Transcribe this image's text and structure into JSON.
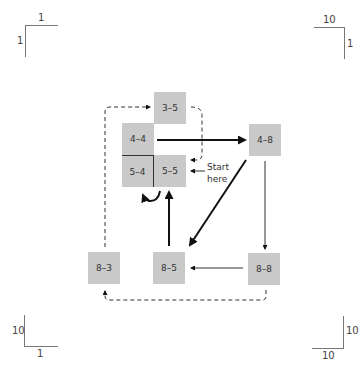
{
  "corners": {
    "top_left": {
      "top_label": "1",
      "side_label": "1"
    },
    "top_right": {
      "top_label": "10",
      "side_label": "1"
    },
    "bottom_left": {
      "side_label": "10",
      "bottom_label": "1"
    },
    "bottom_right": {
      "side_label": "10",
      "bottom_label": "10"
    }
  },
  "cells": [
    {
      "id": "3-5",
      "label": "3–5"
    },
    {
      "id": "4-4",
      "label": "4–4"
    },
    {
      "id": "5-4",
      "label": "5–4"
    },
    {
      "id": "5-5",
      "label": "5–5"
    },
    {
      "id": "4-8",
      "label": "4–8"
    },
    {
      "id": "8-3",
      "label": "8–3"
    },
    {
      "id": "8-5",
      "label": "8–5"
    },
    {
      "id": "8-8",
      "label": "8–8"
    }
  ],
  "annotation": {
    "start_line1": "Start",
    "start_line2": "here"
  },
  "edges": [
    {
      "from": "4-4",
      "to": "4-8",
      "style": "solid-thick"
    },
    {
      "from": "4-8",
      "to": "8-8",
      "style": "solid-thin"
    },
    {
      "from": "4-8",
      "to": "8-5",
      "style": "solid-thick"
    },
    {
      "from": "8-8",
      "to": "8-5",
      "style": "solid-thin"
    },
    {
      "from": "8-5",
      "to": "5-5",
      "style": "solid-thick"
    },
    {
      "from": "5-5",
      "to": "5-4",
      "style": "curved"
    },
    {
      "from": "8-8",
      "to": "8-3",
      "style": "dashed"
    },
    {
      "from": "8-3",
      "to": "3-5",
      "style": "dashed"
    },
    {
      "from": "3-5",
      "to": "5-5",
      "style": "dashed"
    },
    {
      "from": "start",
      "to": "5-5",
      "style": "solid-thin"
    }
  ]
}
